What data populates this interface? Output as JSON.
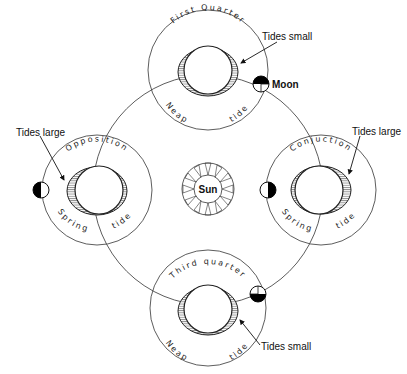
{
  "diagram": {
    "type": "tides-moon-phases",
    "center": {
      "label": "Sun"
    },
    "moon_label": "Moon",
    "positions": [
      {
        "id": "top",
        "phase": "First Quarter",
        "tide": [
          "Neap",
          "tide"
        ],
        "callout": "Tides small"
      },
      {
        "id": "left",
        "phase": "Opposition",
        "tide": [
          "Spring",
          "tide"
        ],
        "callout": "Tides large"
      },
      {
        "id": "right",
        "phase": "Conjuction",
        "tide": [
          "Spring",
          "tide"
        ],
        "callout": "Tides large"
      },
      {
        "id": "bottom",
        "phase": "Third quarter",
        "tide": [
          "Neap",
          "tide"
        ],
        "callout": "Tides small"
      }
    ],
    "colors": {
      "line": "#222222",
      "background": "#ffffff",
      "moon_dark": "#000000"
    }
  }
}
